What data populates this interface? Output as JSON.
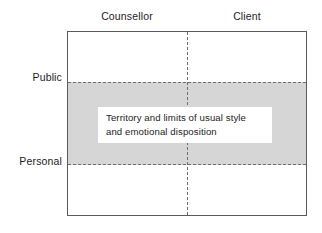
{
  "diagram": {
    "title": "Territory and limits of usual style and emotional disposition",
    "column_headers": [
      {
        "label": "Counsellor"
      },
      {
        "label": "Client"
      }
    ],
    "row_labels": [
      {
        "label": "Public"
      },
      {
        "label": "Personal"
      }
    ],
    "callout": {
      "text": "Territory and limits of usual style and emotional disposition"
    },
    "colors": {
      "band_fill": "#d6d6d6",
      "frame_border": "#5a5a5a",
      "divider": "#6e6e6e",
      "callout_fill": "#ffffff",
      "text": "#1c1c1c",
      "background": "#ffffff"
    }
  }
}
